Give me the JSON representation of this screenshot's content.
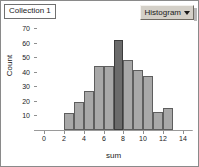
{
  "window": {
    "collection_title": "Collection 1"
  },
  "toolbar": {
    "plot_type_label": "Histogram",
    "caret_icon": "chevron-down-icon"
  },
  "chart_data": {
    "type": "bar",
    "title": "Collection 1",
    "xlabel": "sum",
    "ylabel": "Count",
    "xlim": [
      -1,
      15
    ],
    "ylim": [
      0,
      75
    ],
    "grid": false,
    "legend": null,
    "bin_width": 1,
    "x_ticks": [
      0,
      2,
      4,
      6,
      8,
      10,
      12,
      14
    ],
    "y_ticks": [
      10,
      20,
      30,
      40,
      50,
      60,
      70
    ],
    "x_tick_labels": [
      "0",
      "2",
      "4",
      "6",
      "8",
      "10",
      "12",
      "14"
    ],
    "y_tick_labels": [
      "10",
      "20",
      "30",
      "40",
      "50",
      "60",
      "70"
    ],
    "selected_bin_index": 5,
    "bars": [
      {
        "bin_start": 2,
        "bin_end": 3,
        "value": 12,
        "selected": false
      },
      {
        "bin_start": 3,
        "bin_end": 4,
        "value": 19,
        "selected": false
      },
      {
        "bin_start": 4,
        "bin_end": 5,
        "value": 27,
        "selected": false
      },
      {
        "bin_start": 5,
        "bin_end": 6,
        "value": 44,
        "selected": false
      },
      {
        "bin_start": 6,
        "bin_end": 7,
        "value": 44,
        "selected": false
      },
      {
        "bin_start": 7,
        "bin_end": 8,
        "value": 62,
        "selected": true
      },
      {
        "bin_start": 8,
        "bin_end": 9,
        "value": 48,
        "selected": false
      },
      {
        "bin_start": 9,
        "bin_end": 10,
        "value": 41,
        "selected": false
      },
      {
        "bin_start": 10,
        "bin_end": 11,
        "value": 37.5,
        "selected": false
      },
      {
        "bin_start": 11,
        "bin_end": 12,
        "value": 12.5,
        "selected": false
      },
      {
        "bin_start": 12,
        "bin_end": 13,
        "value": 15,
        "selected": false
      }
    ],
    "categories": [
      "2",
      "3",
      "4",
      "5",
      "6",
      "7",
      "8",
      "9",
      "10",
      "11",
      "12"
    ],
    "values": [
      12,
      19,
      27,
      44,
      44,
      62,
      48,
      41,
      37.5,
      12.5,
      15
    ],
    "colors": {
      "bar_fill": "#a8a8a8",
      "bar_stroke": "#5e5e5e",
      "bar_selected_fill": "#6b6b6b",
      "bar_selected_stroke": "#3c3c3c",
      "axis": "#9a9a9a",
      "text": "#1a1a1a",
      "dropdown_face": "#d4d0c8"
    }
  }
}
